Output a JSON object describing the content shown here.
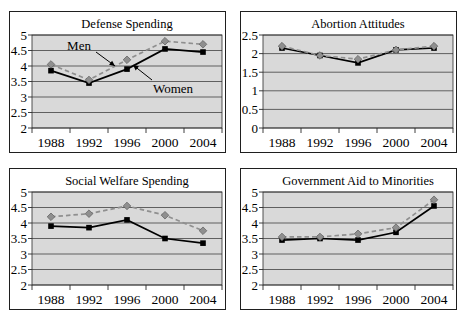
{
  "styles": {
    "page_bg": "#ffffff",
    "chart_bg": "#ffffff",
    "plot_bg": "#d9d9d9",
    "border_color": "#1f1f1f",
    "grid_color": "#2b2b2b",
    "men_color": "#8f8f8f",
    "men_edge": "#5a5a5a",
    "women_color": "#000000",
    "text_color": "#000000"
  },
  "chart_data": [
    {
      "id": "defense-spending",
      "type": "line",
      "title": "Defense Spending",
      "categories": [
        "1988",
        "1992",
        "1996",
        "2000",
        "2004"
      ],
      "xlabel": "",
      "ylabel": "",
      "ylim": [
        2,
        5
      ],
      "yticks": [
        "5",
        "4.5",
        "4",
        "3.5",
        "3",
        "2.5",
        "2"
      ],
      "grid": true,
      "legend_position": "none",
      "series": [
        {
          "name": "Men",
          "style": "dashed-diamond",
          "values": [
            4.05,
            3.55,
            4.2,
            4.8,
            4.7
          ]
        },
        {
          "name": "Women",
          "style": "solid-square",
          "values": [
            3.85,
            3.45,
            3.9,
            4.55,
            4.45
          ]
        }
      ],
      "annotations": [
        {
          "label": "Men",
          "x": 70,
          "y": 39,
          "arrow": {
            "x1": 87,
            "y1": 41,
            "x2": 106,
            "y2": 55
          }
        },
        {
          "label": "Women",
          "x": 164,
          "y": 82,
          "arrow": {
            "x1": 143,
            "y1": 69,
            "x2": 124,
            "y2": 54
          }
        }
      ]
    },
    {
      "id": "abortion-attitudes",
      "type": "line",
      "title": "Abortion Attitudes",
      "categories": [
        "1988",
        "1992",
        "1996",
        "2000",
        "2004"
      ],
      "xlabel": "",
      "ylabel": "",
      "ylim": [
        0,
        2.5
      ],
      "yticks": [
        "2.5",
        "2",
        "1.5",
        "1",
        "0.5",
        "0"
      ],
      "grid": true,
      "legend_position": "none",
      "series": [
        {
          "name": "Men",
          "style": "dashed-diamond",
          "values": [
            2.2,
            1.95,
            1.85,
            2.1,
            2.2
          ]
        },
        {
          "name": "Women",
          "style": "solid-square",
          "values": [
            2.15,
            1.95,
            1.75,
            2.1,
            2.15
          ]
        }
      ],
      "annotations": []
    },
    {
      "id": "social-welfare-spending",
      "type": "line",
      "title": "Social Welfare Spending",
      "categories": [
        "1988",
        "1992",
        "1996",
        "2000",
        "2004"
      ],
      "xlabel": "",
      "ylabel": "",
      "ylim": [
        2,
        5
      ],
      "yticks": [
        "5",
        "4.5",
        "4",
        "3.5",
        "3",
        "2.5",
        "2"
      ],
      "grid": true,
      "legend_position": "none",
      "series": [
        {
          "name": "Men",
          "style": "dashed-diamond",
          "values": [
            4.2,
            4.3,
            4.55,
            4.25,
            3.75
          ]
        },
        {
          "name": "Women",
          "style": "solid-square",
          "values": [
            3.9,
            3.85,
            4.1,
            3.5,
            3.35
          ]
        }
      ],
      "annotations": []
    },
    {
      "id": "government-aid-to-minorities",
      "type": "line",
      "title": "Government Aid to Minorities",
      "categories": [
        "1988",
        "1992",
        "1996",
        "2000",
        "2004"
      ],
      "xlabel": "",
      "ylabel": "",
      "ylim": [
        2,
        5
      ],
      "yticks": [
        "5",
        "4.5",
        "4",
        "3.5",
        "3",
        "2.5",
        "2"
      ],
      "grid": true,
      "legend_position": "none",
      "series": [
        {
          "name": "Men",
          "style": "dashed-diamond",
          "values": [
            3.55,
            3.55,
            3.65,
            3.85,
            4.75
          ]
        },
        {
          "name": "Women",
          "style": "solid-square",
          "values": [
            3.45,
            3.5,
            3.45,
            3.7,
            4.55
          ]
        }
      ],
      "annotations": []
    }
  ]
}
